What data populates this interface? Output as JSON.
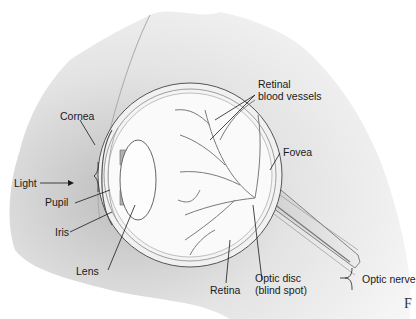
{
  "diagram": {
    "labels": {
      "cornea": "Cornea",
      "light": "Light",
      "pupil": "Pupil",
      "iris": "Iris",
      "lens": "Lens",
      "retinal_vessels": "Retinal\nblood vessels",
      "fovea": "Fovea",
      "optic_nerve": "Optic nerve",
      "optic_disc": "Optic disc\n(blind spot)",
      "retina": "Retina"
    },
    "figure_marker": "F",
    "colors": {
      "background": "#ffffff",
      "paper_shade": "#d9d9d9",
      "vessel": "#7a7a7a",
      "outline": "#555555",
      "leader_line": "#1a1a1a"
    }
  }
}
